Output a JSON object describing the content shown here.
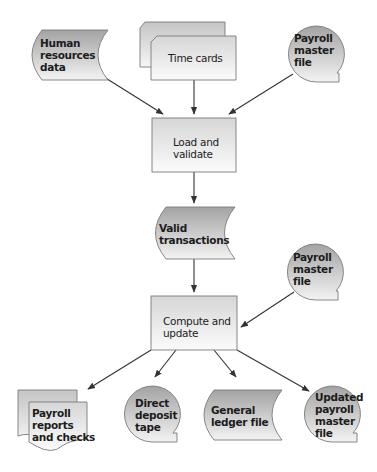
{
  "diagram": {
    "type": "system flowchart",
    "colors": {
      "box_fill_top": "#d9d9d9",
      "box_fill_bottom": "#fafafa",
      "shape_fill_top": "#a8a8a8",
      "shape_fill_bottom": "#f2f2f2",
      "stroke": "#7a7a7a",
      "arrow": "#333333"
    },
    "nodes": {
      "hr_data": {
        "shape": "stored-data",
        "label": "Human\nresources\ndata"
      },
      "time_cards": {
        "shape": "multi-document-card",
        "label": "Time cards"
      },
      "payroll_master_top": {
        "shape": "magnetic-tape",
        "label": "Payroll\nmaster\nfile"
      },
      "load_validate": {
        "shape": "process",
        "label": "Load and\nvalidate"
      },
      "valid_transactions": {
        "shape": "stored-data",
        "label": "Valid\ntransactions"
      },
      "payroll_master_mid": {
        "shape": "magnetic-tape",
        "label": "Payroll\nmaster\nfile"
      },
      "compute_update": {
        "shape": "process",
        "label": "Compute and\nupdate"
      },
      "payroll_reports": {
        "shape": "multi-document",
        "label": "Payroll\nreports\nand checks"
      },
      "direct_deposit": {
        "shape": "magnetic-tape",
        "label": "Direct\ndeposit\ntape"
      },
      "general_ledger": {
        "shape": "stored-data",
        "label": "General\nledger file"
      },
      "updated_payroll": {
        "shape": "magnetic-tape",
        "label": "Updated\npayroll\nmaster\nfile"
      }
    },
    "edges": [
      {
        "from": "hr_data",
        "to": "load_validate"
      },
      {
        "from": "time_cards",
        "to": "load_validate"
      },
      {
        "from": "payroll_master_top",
        "to": "load_validate"
      },
      {
        "from": "load_validate",
        "to": "valid_transactions"
      },
      {
        "from": "valid_transactions",
        "to": "compute_update"
      },
      {
        "from": "payroll_master_mid",
        "to": "compute_update"
      },
      {
        "from": "compute_update",
        "to": "payroll_reports"
      },
      {
        "from": "compute_update",
        "to": "direct_deposit"
      },
      {
        "from": "compute_update",
        "to": "general_ledger"
      },
      {
        "from": "compute_update",
        "to": "updated_payroll"
      }
    ],
    "labels": {
      "hr_1": "Human",
      "hr_2": "resources",
      "hr_3": "data",
      "tc_1": "Time cards",
      "pm1_1": "Payroll",
      "pm1_2": "master",
      "pm1_3": "file",
      "lv_1": "Load and",
      "lv_2": "validate",
      "vt_1": "Valid",
      "vt_2": "transactions",
      "pm2_1": "Payroll",
      "pm2_2": "master",
      "pm2_3": "file",
      "cu_1": "Compute and",
      "cu_2": "update",
      "pr_1": "Payroll",
      "pr_2": "reports",
      "pr_3": "and checks",
      "dd_1": "Direct",
      "dd_2": "deposit",
      "dd_3": "tape",
      "gl_1": "General",
      "gl_2": "ledger file",
      "up_1": "Updated",
      "up_2": "payroll",
      "up_3": "master",
      "up_4": "file"
    }
  }
}
